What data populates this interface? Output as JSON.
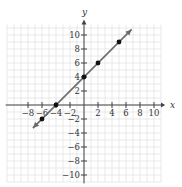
{
  "chart_data": {
    "type": "scatter",
    "title": "",
    "xlabel": "x",
    "ylabel": "y",
    "xlim": [
      -11,
      11
    ],
    "ylim": [
      -11,
      11
    ],
    "grid": true,
    "x_ticks": [
      -8,
      -6,
      -4,
      -2,
      2,
      4,
      6,
      8,
      10
    ],
    "x_tick_labels": [
      "−8",
      "−6",
      "−4",
      "−2",
      "2",
      "4",
      "6",
      "8",
      "10"
    ],
    "y_ticks": [
      10,
      8,
      6,
      4,
      2,
      -2,
      -4,
      -6,
      -8,
      -10
    ],
    "y_tick_labels": [
      "10",
      "8",
      "6",
      "4",
      "2",
      "−2",
      "−4",
      "−6",
      "−8",
      "−10"
    ],
    "series": [
      {
        "name": "line",
        "equation": "y = x + 4",
        "points": [
          [
            -6,
            -2
          ],
          [
            -4,
            0
          ],
          [
            0,
            4
          ],
          [
            2,
            6
          ],
          [
            5,
            9
          ]
        ],
        "line_extent": [
          [
            -7.3,
            -3.3
          ],
          [
            6.8,
            10.8
          ]
        ]
      }
    ],
    "colors": {
      "line": "#6b6b6b",
      "points": "#111111",
      "grid": "#e3e3e3",
      "axes": "#444444"
    }
  }
}
